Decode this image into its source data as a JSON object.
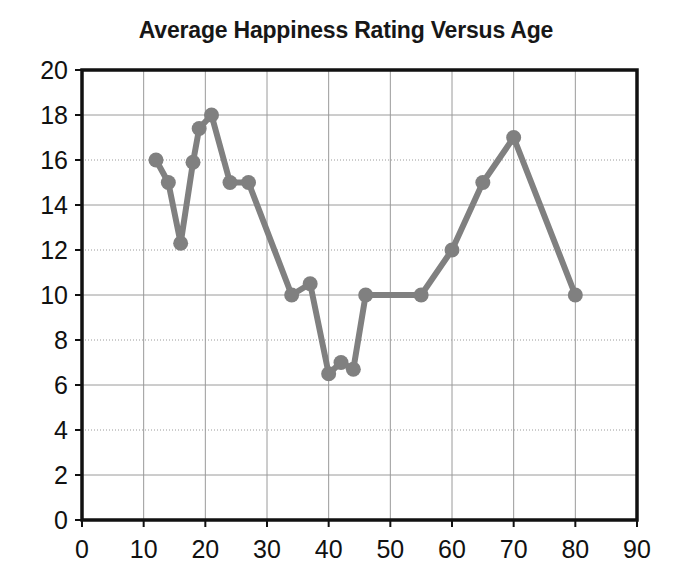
{
  "chart_data": {
    "type": "line",
    "title": "Average Happiness Rating Versus Age",
    "xlabel": "",
    "ylabel": "",
    "xlim": [
      0,
      90
    ],
    "ylim": [
      0,
      20
    ],
    "xticks": [
      0,
      10,
      20,
      30,
      40,
      50,
      60,
      70,
      80,
      90
    ],
    "yticks": [
      0,
      2,
      4,
      6,
      8,
      10,
      12,
      14,
      16,
      18,
      20
    ],
    "grid": "both",
    "legend": "none",
    "marker": "circle",
    "series_color": "#808080",
    "series": [
      {
        "name": "Average Happiness Rating",
        "x": [
          12,
          14,
          16,
          18,
          19,
          21,
          24,
          27,
          34,
          37,
          40,
          42,
          44,
          46,
          55,
          60,
          65,
          70,
          80
        ],
        "y": [
          16,
          15,
          12.3,
          15.9,
          17.4,
          18,
          15,
          15,
          10,
          10.5,
          6.5,
          7,
          6.7,
          10,
          10,
          12,
          15,
          17,
          10
        ]
      }
    ]
  },
  "axes": {
    "x_tick_labels": [
      "0",
      "10",
      "20",
      "30",
      "40",
      "50",
      "60",
      "70",
      "80",
      "90"
    ],
    "y_tick_labels": [
      "0",
      "2",
      "4",
      "6",
      "8",
      "10",
      "12",
      "14",
      "16",
      "18",
      "20"
    ]
  },
  "colors": {
    "series": "#808080",
    "axis": "#111111",
    "grid_solid": "#9a9a9a",
    "grid_dotted": "#9a9a9a",
    "background": "#ffffff"
  }
}
